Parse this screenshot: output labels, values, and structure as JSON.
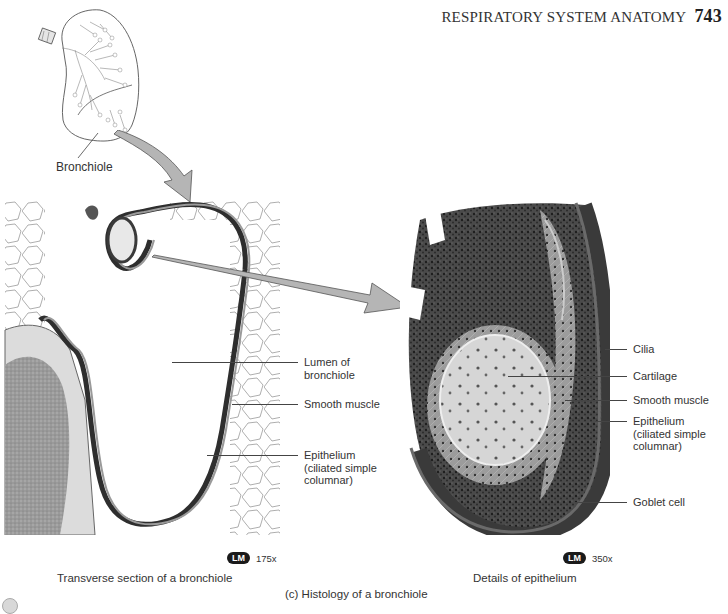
{
  "header": {
    "running_title": "RESPIRATORY SYSTEM ANATOMY",
    "page_number": "743"
  },
  "lung_diagram": {
    "icon": "lung-illustration",
    "label": "Bronchiole"
  },
  "left_panel": {
    "image": "transverse-section-micrograph",
    "labels": {
      "lumen": [
        "Lumen of",
        "bronchiole"
      ],
      "smooth_muscle": "Smooth muscle",
      "epithelium": [
        "Epithelium",
        "(ciliated simple",
        "columnar)"
      ]
    },
    "badge": "LM",
    "magnification": "175x",
    "caption": "Transverse section of a bronchiole"
  },
  "right_panel": {
    "image": "epithelium-detail-micrograph",
    "labels": {
      "cilia": "Cilia",
      "cartilage": "Cartilage",
      "smooth_muscle": "Smooth muscle",
      "epithelium": [
        "Epithelium",
        "(ciliated simple",
        "columnar)"
      ],
      "goblet_cell": "Goblet cell"
    },
    "badge": "LM",
    "magnification": "350x",
    "caption": "Details of epithelium"
  },
  "figure_caption": "(c) Histology of a bronchiole",
  "colors": {
    "arrow_fill": "#b5b5b5",
    "arrow_stroke": "#555555",
    "tissue_dark": "#2e2e2e",
    "tissue_mid": "#8a8a8a",
    "badge_bg": "#1a1a1a"
  }
}
